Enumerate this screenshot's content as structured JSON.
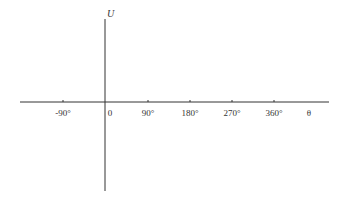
{
  "diagram": {
    "type": "coordinate-axes",
    "y_axis": {
      "label": "U"
    },
    "x_axis": {
      "label": "θ"
    },
    "origin_label": "0",
    "ticks": [
      {
        "label": "-90°",
        "x": 63
      },
      {
        "label": "90°",
        "x": 148
      },
      {
        "label": "180°",
        "x": 190
      },
      {
        "label": "270°",
        "x": 232
      },
      {
        "label": "360°",
        "x": 274
      }
    ],
    "colors": {
      "axis": "#333333",
      "background": "#ffffff"
    }
  }
}
